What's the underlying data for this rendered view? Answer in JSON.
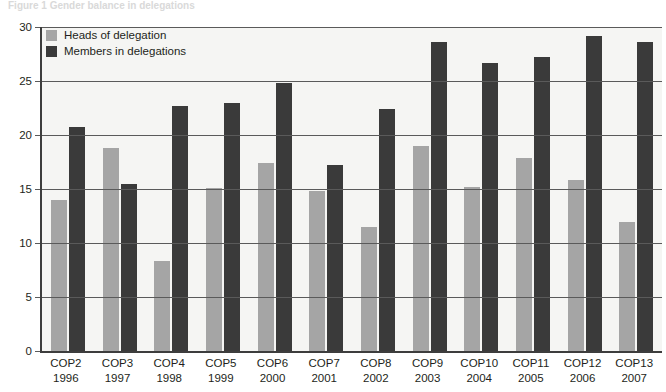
{
  "caption": {
    "text": "Figure 1  Gender balance in delegations"
  },
  "chart_data": {
    "type": "bar",
    "title": "",
    "xlabel": "",
    "ylabel": "",
    "ylim": [
      0,
      30
    ],
    "yticks": [
      0,
      5,
      10,
      15,
      20,
      25,
      30
    ],
    "ytick_labels": [
      "0",
      "5",
      "10",
      "15",
      "20",
      "25",
      "30"
    ],
    "grid": true,
    "legend_position": "top-left",
    "categories": [
      "COP2",
      "COP3",
      "COP4",
      "COP5",
      "COP6",
      "COP7",
      "COP8",
      "COP9",
      "COP10",
      "COP11",
      "COP12",
      "COP13"
    ],
    "category_years": [
      "1996",
      "1997",
      "1998",
      "1999",
      "2000",
      "2001",
      "2002",
      "2003",
      "2004",
      "2005",
      "2006",
      "2007"
    ],
    "series": [
      {
        "name": "Heads of delegation",
        "color": "#a5a5a5",
        "values": [
          14.0,
          18.8,
          8.3,
          15.1,
          17.4,
          14.8,
          11.5,
          19.0,
          15.2,
          17.9,
          15.8,
          11.9
        ]
      },
      {
        "name": "Members in delegations",
        "color": "#3a3a3a",
        "values": [
          20.7,
          15.5,
          22.7,
          23.0,
          24.8,
          17.2,
          22.4,
          28.6,
          26.7,
          27.2,
          29.2,
          28.6
        ]
      }
    ]
  },
  "colors": {
    "light_series": "#a5a5a5",
    "dark_series": "#3a3a3a",
    "plot_background": "#f5f5f3",
    "axis": "#3d3d3d",
    "gridline": "#5a5a5a"
  }
}
